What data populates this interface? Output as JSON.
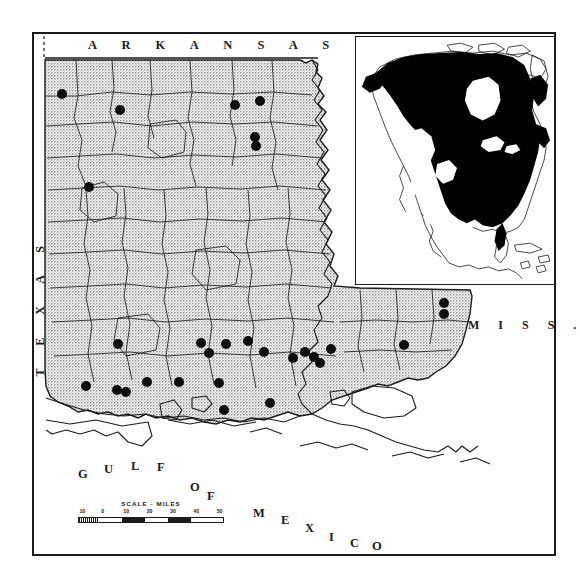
{
  "figure": {
    "kind": "species-distribution-map",
    "region": "Louisiana"
  },
  "labels": {
    "arkansas": "A R K A N S A S",
    "texas": "T E X A S",
    "mississippi": "M I S S .",
    "gulf_of_mexico_letters": [
      "G",
      "U",
      "L",
      "F",
      "O",
      "F",
      "M",
      "E",
      "X",
      "I",
      "C",
      "O"
    ],
    "gulf_of_mexico": "GULF OF MEXICO"
  },
  "scale": {
    "title": "SCALE - MILES",
    "ticks": [
      "10",
      "0",
      "10",
      "20",
      "30",
      "40",
      "50"
    ],
    "unit": "miles",
    "max": 50
  },
  "inset": {
    "title": "North America range inset",
    "shaded_meaning": "species range",
    "shade_color": "#000000",
    "background_color": "#ffffff"
  },
  "colors": {
    "ink": "#1b1b1b",
    "stipple_gray": "#b6b6b6",
    "paper": "#ffffff",
    "dot_fill": "#0d0d0d"
  },
  "chart_data": {
    "type": "scatter",
    "xlabel": "",
    "ylabel": "",
    "legend": [
      {
        "symbol": "filled-circle",
        "label": "collection locality"
      },
      {
        "symbol": "stipple-gray",
        "label": "parish coverage / state area"
      },
      {
        "symbol": "black-fill",
        "label": "continental range (inset)"
      }
    ],
    "point_count": 29,
    "points": [
      {
        "id": 1,
        "x": 62,
        "y": 94
      },
      {
        "id": 2,
        "x": 120,
        "y": 110
      },
      {
        "id": 3,
        "x": 235,
        "y": 105
      },
      {
        "id": 4,
        "x": 260,
        "y": 101
      },
      {
        "id": 5,
        "x": 255,
        "y": 137
      },
      {
        "id": 6,
        "x": 256,
        "y": 146
      },
      {
        "id": 7,
        "x": 89,
        "y": 187
      },
      {
        "id": 8,
        "x": 118,
        "y": 344
      },
      {
        "id": 9,
        "x": 201,
        "y": 343
      },
      {
        "id": 10,
        "x": 209,
        "y": 353
      },
      {
        "id": 11,
        "x": 226,
        "y": 344
      },
      {
        "id": 12,
        "x": 264,
        "y": 352
      },
      {
        "id": 13,
        "x": 293,
        "y": 358
      },
      {
        "id": 14,
        "x": 305,
        "y": 352
      },
      {
        "id": 15,
        "x": 314,
        "y": 357
      },
      {
        "id": 16,
        "x": 320,
        "y": 363
      },
      {
        "id": 17,
        "x": 147,
        "y": 382
      },
      {
        "id": 18,
        "x": 179,
        "y": 382
      },
      {
        "id": 19,
        "x": 219,
        "y": 383
      },
      {
        "id": 20,
        "x": 117,
        "y": 390
      },
      {
        "id": 21,
        "x": 126,
        "y": 392
      },
      {
        "id": 22,
        "x": 270,
        "y": 403
      },
      {
        "id": 23,
        "x": 404,
        "y": 345
      },
      {
        "id": 24,
        "x": 444,
        "y": 303
      },
      {
        "id": 25,
        "x": 444,
        "y": 314
      },
      {
        "id": 26,
        "x": 86,
        "y": 386
      },
      {
        "id": 27,
        "x": 224,
        "y": 410
      },
      {
        "id": 28,
        "x": 248,
        "y": 341
      },
      {
        "id": 29,
        "x": 331,
        "y": 349
      }
    ]
  }
}
